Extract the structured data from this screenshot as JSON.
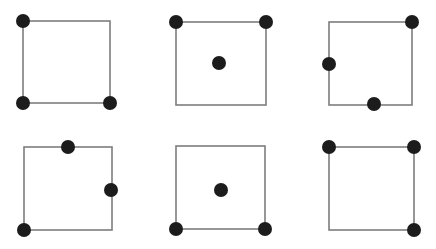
{
  "figure": {
    "title": "",
    "width": 436,
    "height": 249,
    "background_color": "#ffffff",
    "square_stroke_color": "#7d7d7d",
    "square_stroke_width": 1.6,
    "dot_color": "#1c1c1c",
    "dot_diameter": 14,
    "grid_rows": 2,
    "grid_cols": 3,
    "panel_count": 6
  },
  "panels": [
    {
      "id": "panel-1",
      "index": 1,
      "row": 1,
      "col": 1,
      "origin": {
        "x": 0,
        "y": 0
      },
      "square": {
        "x": 23,
        "y": 21,
        "width": 87,
        "height": 82
      },
      "dot_count": 3,
      "dots": [
        {
          "name": "top-left-corner",
          "x": 23,
          "y": 21,
          "r": 7,
          "position": "corner"
        },
        {
          "name": "bottom-left-corner",
          "x": 23,
          "y": 103,
          "r": 7,
          "position": "corner"
        },
        {
          "name": "bottom-right-corner",
          "x": 110,
          "y": 103,
          "r": 7,
          "position": "corner"
        }
      ]
    },
    {
      "id": "panel-2",
      "index": 2,
      "row": 1,
      "col": 2,
      "origin": {
        "x": 0,
        "y": 0
      },
      "square": {
        "x": 176,
        "y": 22,
        "width": 90,
        "height": 83
      },
      "dot_count": 3,
      "dots": [
        {
          "name": "top-left-corner",
          "x": 176,
          "y": 22,
          "r": 7,
          "position": "corner"
        },
        {
          "name": "top-right-corner",
          "x": 266,
          "y": 22,
          "r": 7,
          "position": "corner"
        },
        {
          "name": "center",
          "x": 219,
          "y": 63,
          "r": 7,
          "position": "interior"
        }
      ]
    },
    {
      "id": "panel-3",
      "index": 3,
      "row": 1,
      "col": 3,
      "origin": {
        "x": 0,
        "y": 0
      },
      "square": {
        "x": 329,
        "y": 22,
        "width": 83,
        "height": 83
      },
      "dot_count": 3,
      "dots": [
        {
          "name": "top-right-corner",
          "x": 412,
          "y": 22,
          "r": 7,
          "position": "corner"
        },
        {
          "name": "left-edge-midpoint",
          "x": 329,
          "y": 64,
          "r": 7,
          "position": "edge"
        },
        {
          "name": "bottom-edge-midpoint",
          "x": 374,
          "y": 104,
          "r": 7,
          "position": "edge"
        }
      ]
    },
    {
      "id": "panel-4",
      "index": 4,
      "row": 2,
      "col": 1,
      "origin": {
        "x": 0,
        "y": 0
      },
      "square": {
        "x": 24,
        "y": 147,
        "width": 88,
        "height": 83
      },
      "dot_count": 3,
      "dots": [
        {
          "name": "top-edge-midpoint",
          "x": 68,
          "y": 147,
          "r": 7,
          "position": "edge"
        },
        {
          "name": "right-edge-midpoint",
          "x": 111,
          "y": 190,
          "r": 7,
          "position": "edge"
        },
        {
          "name": "bottom-left-corner",
          "x": 24,
          "y": 230,
          "r": 7,
          "position": "corner"
        }
      ]
    },
    {
      "id": "panel-5",
      "index": 5,
      "row": 2,
      "col": 2,
      "origin": {
        "x": 0,
        "y": 0
      },
      "square": {
        "x": 176,
        "y": 146,
        "width": 89,
        "height": 83
      },
      "dot_count": 3,
      "dots": [
        {
          "name": "center",
          "x": 221,
          "y": 190,
          "r": 7,
          "position": "interior"
        },
        {
          "name": "bottom-left-corner",
          "x": 176,
          "y": 229,
          "r": 7,
          "position": "corner"
        },
        {
          "name": "bottom-right-corner",
          "x": 265,
          "y": 229,
          "r": 7,
          "position": "corner"
        }
      ]
    },
    {
      "id": "panel-6",
      "index": 6,
      "row": 2,
      "col": 3,
      "origin": {
        "x": 0,
        "y": 0
      },
      "square": {
        "x": 329,
        "y": 147,
        "width": 85,
        "height": 83
      },
      "dot_count": 3,
      "dots": [
        {
          "name": "top-left-corner",
          "x": 329,
          "y": 147,
          "r": 7,
          "position": "corner"
        },
        {
          "name": "top-right-corner",
          "x": 414,
          "y": 147,
          "r": 7,
          "position": "corner"
        },
        {
          "name": "bottom-right-corner",
          "x": 414,
          "y": 230,
          "r": 7,
          "position": "corner"
        }
      ]
    }
  ]
}
